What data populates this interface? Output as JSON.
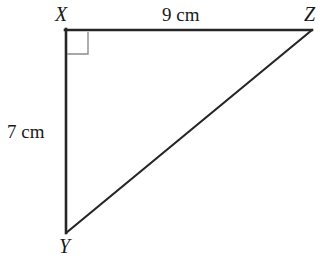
{
  "figure": {
    "kind": "right-triangle-diagram",
    "background_color": "#ffffff",
    "stroke_color": "#262626",
    "right_angle_mark_color": "#8c8c8c",
    "vertices": [
      {
        "name": "X",
        "label": "X",
        "x": 66,
        "y": 30,
        "label_x": 55,
        "label_y": 4
      },
      {
        "name": "Z",
        "label": "Z",
        "x": 312,
        "y": 30,
        "label_x": 304,
        "label_y": 4
      },
      {
        "name": "Y",
        "label": "Y",
        "x": 66,
        "y": 233,
        "label_x": 59,
        "label_y": 236
      }
    ],
    "sides": [
      {
        "name": "XZ",
        "from": "X",
        "to": "Z",
        "label": "9 cm",
        "measure": 9,
        "unit": "cm",
        "label_x": 162,
        "label_y": 5
      },
      {
        "name": "XY",
        "from": "X",
        "to": "Y",
        "label": "7 cm",
        "measure": 7,
        "unit": "cm",
        "label_x": 7,
        "label_y": 122
      },
      {
        "name": "YZ",
        "from": "Y",
        "to": "Z",
        "label": "",
        "measure": null,
        "unit": "",
        "label_x": null,
        "label_y": null
      }
    ],
    "right_angle": {
      "at_vertex": "X",
      "size": 22,
      "description": "right-angle-square-mark"
    }
  }
}
